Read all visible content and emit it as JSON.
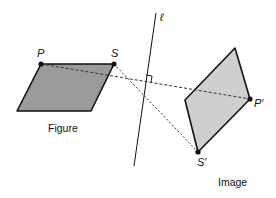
{
  "diagram": {
    "type": "reflection",
    "line_label": "ℓ",
    "figure": {
      "caption": "Figure",
      "fill": "#9a9a9a",
      "vertices": {
        "P": "P",
        "S": "S"
      }
    },
    "image": {
      "caption": "Image",
      "fill": "#cfcfcf",
      "vertices": {
        "P_prime": "P′",
        "S_prime": "S′"
      }
    },
    "right_angle_marker": true,
    "connectors": [
      "P–P′ (dashed)",
      "S–S′ (dashed)"
    ]
  },
  "colors": {
    "stroke": "#111111",
    "figure_fill": "#9a9a9a",
    "image_fill": "#cfcfcf",
    "background": "#ffffff"
  }
}
